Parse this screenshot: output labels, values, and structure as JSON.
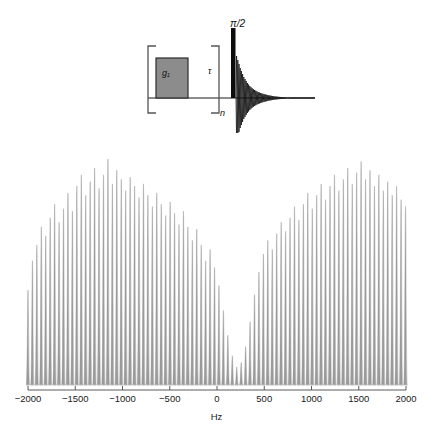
{
  "figure": {
    "name": "nmr-sideband-spectrum-figure"
  },
  "pulse_sequence": {
    "gradient_label": "g₁",
    "delay_label": "τ",
    "repeat_label": "n",
    "pulse_label": "π/2",
    "gradient_fill": "#8c8c8c",
    "gradient_stroke": "#2b2b2b",
    "line_color": "#1a1a1a",
    "bracket_color": "#555555"
  },
  "axis": {
    "title": "Hz",
    "tick_labels": [
      "−2000",
      "−1500",
      "−1000",
      "−500",
      "0",
      "500",
      "1000",
      "1500",
      "2000"
    ],
    "tick_values": [
      -2000,
      -1500,
      -1000,
      -500,
      0,
      500,
      1000,
      1500,
      2000
    ],
    "xmin": -2000,
    "xmax": 2000,
    "axis_color": "#5a5a5a"
  },
  "chart_data": {
    "type": "line",
    "title": "",
    "xlabel": "Hz",
    "ylabel": "",
    "xlim": [
      -2150,
      2150
    ],
    "ylim": [
      0,
      1
    ],
    "grid": false,
    "legend": null,
    "series_name": "sideband comb",
    "peak_spacing_hz": 47,
    "line_color": "#9a9a9a",
    "annotation": "Comb of gradient-modulated sidebands with a deep null at 0 Hz",
    "x": [
      -2000,
      -1953,
      -1906,
      -1859,
      -1812,
      -1765,
      -1718,
      -1671,
      -1624,
      -1577,
      -1530,
      -1483,
      -1436,
      -1389,
      -1342,
      -1295,
      -1248,
      -1201,
      -1154,
      -1107,
      -1060,
      -1013,
      -966,
      -919,
      -872,
      -825,
      -778,
      -731,
      -684,
      -637,
      -590,
      -543,
      -496,
      -449,
      -402,
      -355,
      -308,
      -261,
      -214,
      -167,
      -120,
      -73,
      -26,
      21,
      68,
      115,
      162,
      209,
      256,
      303,
      350,
      397,
      444,
      491,
      538,
      585,
      632,
      679,
      726,
      773,
      820,
      867,
      914,
      961,
      1008,
      1055,
      1102,
      1149,
      1196,
      1243,
      1290,
      1337,
      1384,
      1431,
      1478,
      1525,
      1572,
      1619,
      1666,
      1713,
      1760,
      1807,
      1854,
      1901,
      1948,
      1995
    ],
    "values": [
      0.42,
      0.55,
      0.62,
      0.7,
      0.66,
      0.74,
      0.8,
      0.72,
      0.78,
      0.85,
      0.77,
      0.88,
      0.93,
      0.84,
      0.9,
      0.96,
      0.87,
      0.93,
      1.0,
      0.89,
      0.95,
      0.91,
      0.86,
      0.92,
      0.88,
      0.83,
      0.89,
      0.84,
      0.79,
      0.85,
      0.8,
      0.75,
      0.81,
      0.76,
      0.71,
      0.77,
      0.7,
      0.64,
      0.69,
      0.62,
      0.55,
      0.6,
      0.52,
      0.44,
      0.33,
      0.22,
      0.13,
      0.08,
      0.1,
      0.17,
      0.28,
      0.4,
      0.5,
      0.58,
      0.64,
      0.6,
      0.67,
      0.72,
      0.68,
      0.74,
      0.79,
      0.73,
      0.8,
      0.85,
      0.78,
      0.84,
      0.89,
      0.82,
      0.88,
      0.93,
      0.86,
      0.91,
      0.96,
      0.89,
      0.94,
      0.99,
      0.91,
      0.95,
      0.88,
      0.93,
      0.86,
      0.9,
      0.84,
      0.88,
      0.82,
      0.79
    ]
  }
}
